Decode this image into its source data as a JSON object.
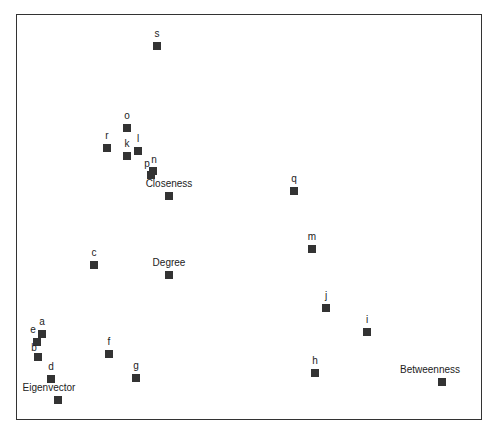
{
  "chart_data": {
    "type": "scatter",
    "title": "",
    "xlabel": "",
    "ylabel": "",
    "grid": false,
    "legend": null,
    "points": [
      {
        "label": "s",
        "x": 157,
        "y": 46
      },
      {
        "label": "o",
        "x": 127,
        "y": 128
      },
      {
        "label": "r",
        "x": 107,
        "y": 148
      },
      {
        "label": "k",
        "x": 127,
        "y": 156
      },
      {
        "label": "l",
        "x": 138,
        "y": 151
      },
      {
        "label": "n",
        "x": 153,
        "y": 171
      },
      {
        "label": "p",
        "x": 151,
        "y": 175
      },
      {
        "label": "Closeness",
        "x": 169,
        "y": 196
      },
      {
        "label": "q",
        "x": 294,
        "y": 191
      },
      {
        "label": "m",
        "x": 312,
        "y": 249
      },
      {
        "label": "c",
        "x": 94,
        "y": 265
      },
      {
        "label": "Degree",
        "x": 169,
        "y": 275
      },
      {
        "label": "j",
        "x": 326,
        "y": 308
      },
      {
        "label": "i",
        "x": 367,
        "y": 332
      },
      {
        "label": "a",
        "x": 42,
        "y": 334
      },
      {
        "label": "e",
        "x": 37,
        "y": 342
      },
      {
        "label": "b",
        "x": 38,
        "y": 357
      },
      {
        "label": "f",
        "x": 109,
        "y": 354
      },
      {
        "label": "h",
        "x": 315,
        "y": 373
      },
      {
        "label": "g",
        "x": 136,
        "y": 378
      },
      {
        "label": "d",
        "x": 51,
        "y": 379
      },
      {
        "label": "Betweenness",
        "x": 442,
        "y": 382
      },
      {
        "label": "Eigenvector",
        "x": 58,
        "y": 400
      }
    ],
    "axis_ticks": "none shown"
  }
}
